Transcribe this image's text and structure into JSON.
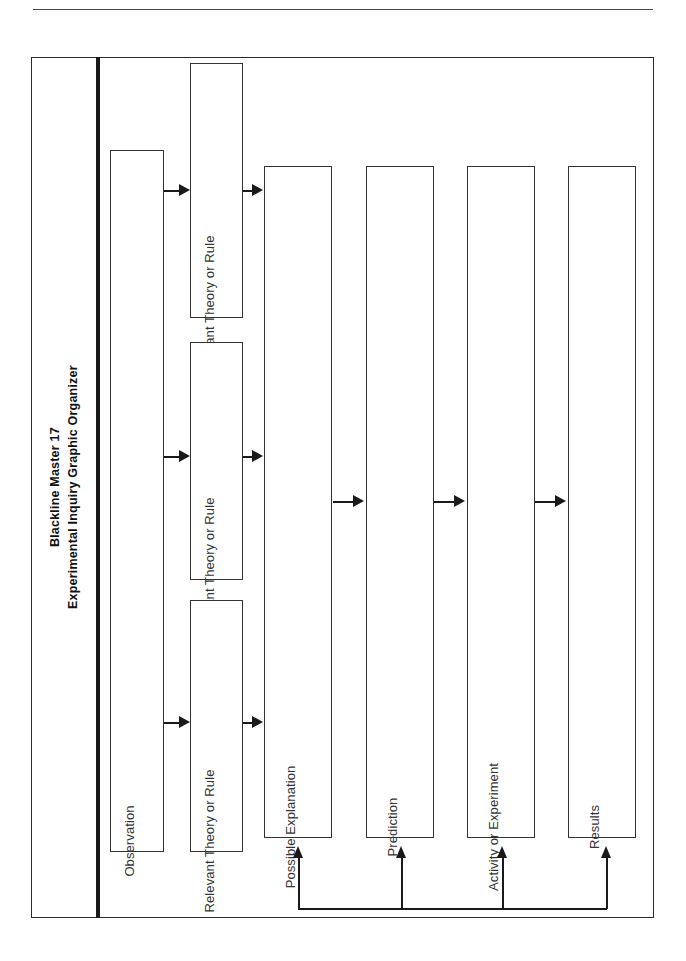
{
  "document": {
    "title_line_1": "Blackline Master 17",
    "title_line_2": "Experimental Inquiry Graphic Organizer",
    "orientation": "landscape-rotated-labels",
    "ink_color": "#1a1a1a",
    "paper_color": "#ffffff"
  },
  "diagram": {
    "type": "flowchart",
    "observation": {
      "label": "Observation"
    },
    "theory_boxes": [
      {
        "label": "Relevant Theory or Rule"
      },
      {
        "label": "Relevant Theory or Rule"
      },
      {
        "label": "Relevant Theory or Rule"
      }
    ],
    "process_boxes": [
      {
        "label": "Possible Explanation"
      },
      {
        "label": "Prediction"
      },
      {
        "label": "Activity or Experiment"
      },
      {
        "label": "Results"
      }
    ],
    "feedback_loop": {
      "description": "Results feed back into Possible Explanation, Prediction, Activity or Experiment and Results",
      "targets": [
        "Possible Explanation",
        "Prediction",
        "Activity or Experiment",
        "Results"
      ]
    },
    "connectors": [
      {
        "from": "Observation",
        "to": "Relevant Theory or Rule",
        "direction": "right"
      },
      {
        "from": "Observation",
        "to": "Relevant Theory or Rule",
        "direction": "right"
      },
      {
        "from": "Observation",
        "to": "Relevant Theory or Rule",
        "direction": "right"
      },
      {
        "from": "Relevant Theory or Rule",
        "to": "Possible Explanation",
        "direction": "right"
      },
      {
        "from": "Relevant Theory or Rule",
        "to": "Possible Explanation",
        "direction": "right"
      },
      {
        "from": "Relevant Theory or Rule",
        "to": "Possible Explanation",
        "direction": "right"
      },
      {
        "from": "Possible Explanation",
        "to": "Prediction",
        "direction": "right"
      },
      {
        "from": "Prediction",
        "to": "Activity or Experiment",
        "direction": "right"
      },
      {
        "from": "Activity or Experiment",
        "to": "Results",
        "direction": "right"
      }
    ]
  }
}
